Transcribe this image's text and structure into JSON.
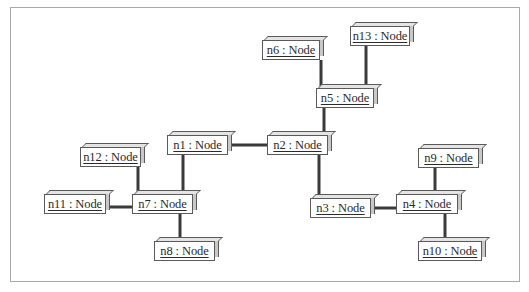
{
  "diagram": {
    "type": "UML object diagram",
    "nodes": [
      {
        "id": "n1",
        "label": "n1 : Node",
        "x": 167,
        "y": 135,
        "w": 61
      },
      {
        "id": "n2",
        "label": "n2 : Node",
        "x": 267,
        "y": 135,
        "w": 61
      },
      {
        "id": "n3",
        "label": "n3 : Node",
        "x": 310,
        "y": 198,
        "w": 61
      },
      {
        "id": "n4",
        "label": "n4 : Node",
        "x": 396,
        "y": 194,
        "w": 62
      },
      {
        "id": "n5",
        "label": "n5 : Node",
        "x": 316,
        "y": 88,
        "w": 58
      },
      {
        "id": "n6",
        "label": "n6 : Node",
        "x": 262,
        "y": 40,
        "w": 58
      },
      {
        "id": "n7",
        "label": "n7 : Node",
        "x": 132,
        "y": 194,
        "w": 61
      },
      {
        "id": "n8",
        "label": "n8 : Node",
        "x": 154,
        "y": 241,
        "w": 61
      },
      {
        "id": "n9",
        "label": "n9 : Node",
        "x": 418,
        "y": 148,
        "w": 61
      },
      {
        "id": "n10",
        "label": "n10 : Node",
        "x": 418,
        "y": 241,
        "w": 64
      },
      {
        "id": "n11",
        "label": "n11 : Node",
        "x": 44,
        "y": 194,
        "w": 62
      },
      {
        "id": "n12",
        "label": "n12 : Node",
        "x": 80,
        "y": 147,
        "w": 61
      },
      {
        "id": "n13",
        "label": "n13 : Node",
        "x": 350,
        "y": 26,
        "w": 60
      }
    ],
    "links": [
      {
        "from": "n1",
        "to": "n2",
        "x1": 228,
        "y1": 145,
        "x2": 267,
        "y2": 145
      },
      {
        "from": "n2",
        "to": "n5",
        "x1": 324,
        "y1": 135,
        "x2": 324,
        "y2": 108
      },
      {
        "from": "n5",
        "to": "n6",
        "x1": 321,
        "y1": 88,
        "x2": 321,
        "y2": 60
      },
      {
        "from": "n5",
        "to": "n13",
        "x1": 366,
        "y1": 88,
        "x2": 366,
        "y2": 46
      },
      {
        "from": "n2",
        "to": "n3",
        "x1": 319,
        "y1": 155,
        "x2": 319,
        "y2": 198
      },
      {
        "from": "n3",
        "to": "n4",
        "x1": 371,
        "y1": 208,
        "x2": 396,
        "y2": 208
      },
      {
        "from": "n4",
        "to": "n9",
        "x1": 435,
        "y1": 194,
        "x2": 435,
        "y2": 168
      },
      {
        "from": "n4",
        "to": "n10",
        "x1": 445,
        "y1": 214,
        "x2": 445,
        "y2": 241
      },
      {
        "from": "n1",
        "to": "n7",
        "x1": 183,
        "y1": 155,
        "x2": 183,
        "y2": 194
      },
      {
        "from": "n7",
        "to": "n12",
        "x1": 138,
        "y1": 194,
        "x2": 138,
        "y2": 167
      },
      {
        "from": "n7",
        "to": "n11",
        "x1": 106,
        "y1": 207,
        "x2": 132,
        "y2": 207
      },
      {
        "from": "n7",
        "to": "n8",
        "x1": 180,
        "y1": 214,
        "x2": 180,
        "y2": 241
      }
    ]
  },
  "colors": {
    "frame_border": "#a9a9a9",
    "node_border": "#5a5a5a",
    "link": "#3a3a3a",
    "text": "#2a2a2a"
  }
}
